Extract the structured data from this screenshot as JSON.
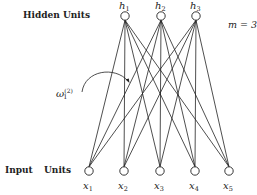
{
  "labels": {
    "hidden_units": "Hidden Units",
    "input": "Input",
    "units": "Units",
    "m_equation": "m = 3"
  },
  "weight_label": {
    "symbol": "ω",
    "sub": "1",
    "sup": "(2)"
  },
  "hidden_nodes": [
    {
      "name": "h",
      "sub": "1",
      "x": 125,
      "y": 16
    },
    {
      "name": "h",
      "sub": "2",
      "x": 161,
      "y": 16
    },
    {
      "name": "h",
      "sub": "3",
      "x": 196,
      "y": 16
    }
  ],
  "input_nodes": [
    {
      "name": "x",
      "sub": "1",
      "x": 89,
      "y": 171
    },
    {
      "name": "x",
      "sub": "2",
      "x": 124,
      "y": 171
    },
    {
      "name": "x",
      "sub": "3",
      "x": 160,
      "y": 171
    },
    {
      "name": "x",
      "sub": "4",
      "x": 195,
      "y": 171
    },
    {
      "name": "x",
      "sub": "5",
      "x": 229,
      "y": 171
    }
  ],
  "node_radius": 4.2,
  "colors": {
    "stroke": "#222222",
    "background": "#ffffff"
  }
}
